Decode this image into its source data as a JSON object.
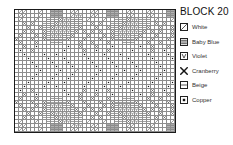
{
  "title": "BLOCK 20",
  "legend": {
    "items": [
      {
        "symbol": "diagonal-slash",
        "label": "White",
        "color": "#ffffff"
      },
      {
        "symbol": "triple-bar",
        "label": "Baby Blue",
        "color": "#a8cde8"
      },
      {
        "symbol": "letter-v",
        "label": "Violet",
        "color": "#7a5ca6"
      },
      {
        "symbol": "cross-x",
        "label": "Cranberry",
        "color": "#8c1f3d"
      },
      {
        "symbol": "single-dash",
        "label": "Beige",
        "color": "#d9c9a8"
      },
      {
        "symbol": "filled-square",
        "label": "Copper",
        "color": "#9c5a27"
      }
    ]
  },
  "chart_data": {
    "type": "heatmap",
    "title": "BLOCK 20",
    "xlabel": "",
    "ylabel": "",
    "grid": true,
    "legend_position": "right",
    "columns": 40,
    "rows": 31,
    "symbol_key": {
      "0": "blank",
      "1": "diagonal-slash",
      "2": "triple-bar",
      "3": "letter-v",
      "4": "cross-x",
      "5": "single-dash",
      "6": "filled-square"
    },
    "cells": [
      "0110001002220011000110022200110001100022001100",
      "0110001002220013300110022200110001100022001100",
      "0100010055543355501000100555433555010001005554",
      "0040400555433355500404005554333555040400055543",
      "0004004554333355400040045543333554004004455433",
      "0040400453333354040404004533333540404004533335",
      "0400040453335540004000404533355400040004533355",
      "4000400455555400040004004555554000400040045555",
      "0400040005550000400400040005550004004000400055",
      "0040060000000600400040006000000600400040060000",
      "0600400000006000040060040000060000400600400000",
      "0060000600600000060000600060000006000060000600",
      "0006000060006000006000060000600000600006000060",
      "0000600006000600000600006000060000060000600006",
      "0000060000600060000060000600006000006000060000",
      "0000006000060001000006000006000600000600000600",
      "0000060000600060000060000600006000006000060000",
      "0000600006000600000600006000060000060000600006",
      "0006000060006000006000060000600000600006000060",
      "0060000600600000060000600060000006000060000600",
      "0600400000006000040060040000060000400600400000",
      "0040060000000600400040006000000600400040060000",
      "0400040005550000400400040005550004004000400055",
      "4000400455555400040004004555554000400040045555",
      "0400040453335540004000404533355400040004533355",
      "0040400453333354040404004533333540404004533335",
      "0004004554333355400040045543333554004004455433",
      "0040400555433355500404005554333555040400055543",
      "0100010055543355501000100555433555010001005554",
      "0110001002220013300110022200110001100022001100",
      "0110001002220011000110022200110001100022001100"
    ]
  }
}
